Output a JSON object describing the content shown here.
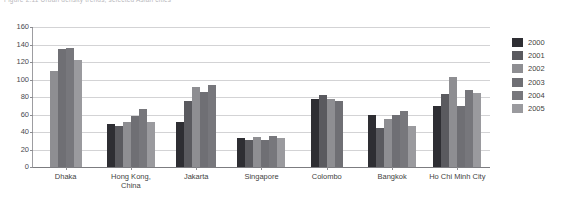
{
  "caption": {
    "text": "Figure 2.11  Urban density trends, selected Asian cities"
  },
  "chart_data": {
    "type": "bar",
    "title": "",
    "subtitle": "",
    "xlabel": "",
    "ylabel": "",
    "ylim": [
      0,
      160
    ],
    "ytick_step": 20,
    "yticks": [
      0,
      20,
      40,
      60,
      80,
      100,
      120,
      140,
      160
    ],
    "ytick_labels": [
      "0",
      "20",
      "40",
      "60",
      "80",
      "100",
      "120",
      "140",
      "160"
    ],
    "grid": true,
    "legend_position": "right",
    "categories": [
      "Dhaka",
      "Hong Kong, China",
      "Jakarta",
      "Singapore",
      "Colombo",
      "Bangkok",
      "Ho Chi Minh City"
    ],
    "category_lines": [
      [
        "Dhaka"
      ],
      [
        "Hong Kong,",
        "China"
      ],
      [
        "Jakarta"
      ],
      [
        "Singapore"
      ],
      [
        "Colombo"
      ],
      [
        "Bangkok"
      ],
      [
        "Ho Chi Minh City"
      ]
    ],
    "series": [
      {
        "name": "2000",
        "color": "#2e2e33",
        "values": [
          null,
          49,
          51,
          33,
          78,
          59,
          70
        ]
      },
      {
        "name": "2001",
        "color": "#5a5a5f",
        "values": [
          null,
          47,
          76,
          31,
          82,
          45,
          83
        ]
      },
      {
        "name": "2002",
        "color": "#8e8e92",
        "values": [
          110,
          52,
          92,
          34,
          78,
          55,
          103
        ]
      },
      {
        "name": "2003",
        "color": "#6f6f74",
        "values": [
          135,
          58,
          86,
          31,
          75,
          60,
          70
        ]
      },
      {
        "name": "2004",
        "color": "#77777c",
        "values": [
          136,
          66,
          94,
          35,
          null,
          64,
          88
        ]
      },
      {
        "name": "2005",
        "color": "#9a9a9e",
        "values": [
          122,
          52,
          null,
          33,
          null,
          47,
          85
        ]
      }
    ]
  }
}
